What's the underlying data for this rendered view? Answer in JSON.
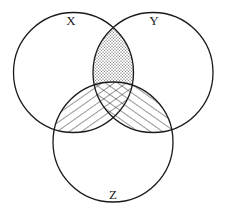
{
  "diagram": {
    "type": "venn",
    "sets": [
      {
        "id": "X",
        "label": "X",
        "cx": 73.5,
        "cy": 72.5,
        "r": 60,
        "label_x": 71,
        "label_y": 25
      },
      {
        "id": "Y",
        "label": "Y",
        "cx": 153,
        "cy": 72.5,
        "r": 60,
        "label_x": 154,
        "label_y": 25
      },
      {
        "id": "Z",
        "label": "Z",
        "cx": 113,
        "cy": 142,
        "r": 60,
        "label_x": 113,
        "label_y": 199
      }
    ],
    "shaded_regions": [
      {
        "region": "X∩Y−Z",
        "pattern": "dots"
      },
      {
        "region": "X∩Z−Y",
        "pattern": "diagonal-up-right"
      },
      {
        "region": "Y∩Z−X",
        "pattern": "diagonal-down-right"
      },
      {
        "region": "X∩Y∩Z",
        "pattern": "crosshatch"
      }
    ],
    "stroke_color": "#1a1a1a",
    "background": "#ffffff"
  }
}
